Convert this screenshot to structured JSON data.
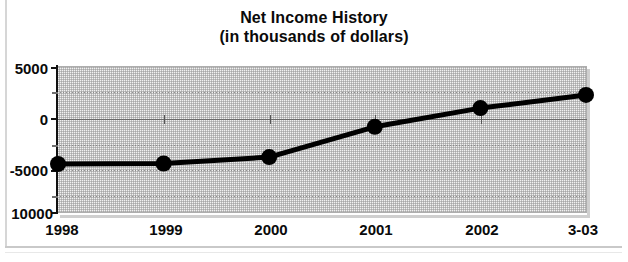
{
  "document": {
    "type": "scanned-page-figure",
    "border_color": "#d6d6d6"
  },
  "title": {
    "line1": "Net Income History",
    "line2": "(in thousands of dollars)"
  },
  "chart_data": {
    "type": "line",
    "title": "Net Income History\n(in thousands of dollars)",
    "subtitle": "(in thousands of dollars)",
    "xlabel": "",
    "ylabel": "",
    "categories": [
      "1998",
      "1999",
      "2000",
      "2001",
      "2002",
      "3-03"
    ],
    "values": [
      -5000,
      -4950,
      -4300,
      -1200,
      700,
      2050
    ],
    "series": [
      {
        "name": "Net Income",
        "values": [
          -5000,
          -4950,
          -4300,
          -1200,
          700,
          2050
        ]
      }
    ],
    "ylim": [
      -10000,
      5000
    ],
    "ytick_labels": [
      "5000",
      "0",
      "-5000",
      "10000"
    ],
    "ytick_values": [
      5000,
      0,
      -5000,
      -10000
    ],
    "yticks_minor": [
      2500,
      -2500,
      -7500
    ],
    "grid": true,
    "grid_color": "#828282",
    "zero_line": true,
    "zero_line_color": "#6a6a6a",
    "legend": false,
    "line_color": "#000000",
    "line_width_px": 5,
    "marker": "circle",
    "marker_color": "#000000",
    "marker_radius_px": 8,
    "plot_background": "#f1f1f1"
  },
  "axes": {
    "y_labels": [
      {
        "text": "5000",
        "value": 5000
      },
      {
        "text": "0",
        "value": 0
      },
      {
        "text": "-5000",
        "value": -5000
      },
      {
        "text": "10000",
        "value": -10000
      }
    ],
    "x_labels": [
      "1998",
      "1999",
      "2000",
      "2001",
      "2002",
      "3-03"
    ]
  }
}
